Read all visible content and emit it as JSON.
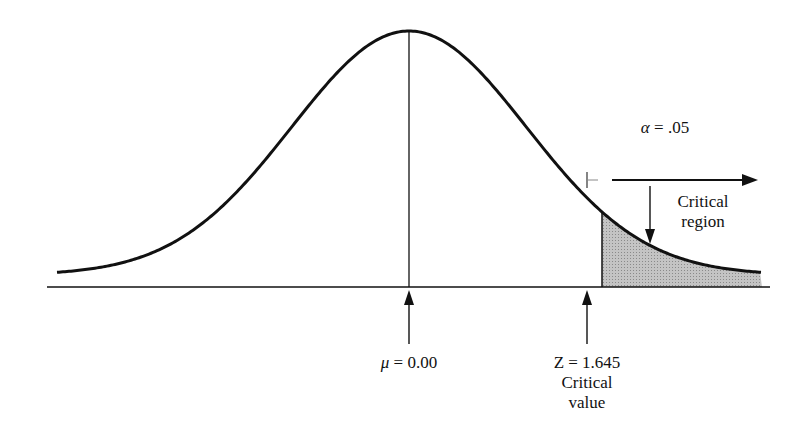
{
  "chart_data": {
    "type": "area",
    "title": "",
    "distribution": "standard normal",
    "mean": 0.0,
    "alpha": 0.05,
    "critical_value": 1.645,
    "shaded_region": "right tail beyond Z = 1.645",
    "xlim": [
      -3.0,
      3.0
    ],
    "grid": false,
    "legend": "none"
  },
  "labels": {
    "alpha": {
      "symbol": "α",
      "text": " = .05"
    },
    "critical_region": [
      "Critical",
      "region"
    ],
    "mean": {
      "symbol": "μ",
      "text": " = 0.00"
    },
    "critical_value": [
      "Z = 1.645",
      "Critical",
      "value"
    ]
  },
  "colors": {
    "curve": "#111111",
    "shade": "#b8b8b8",
    "background": "#ffffff"
  }
}
